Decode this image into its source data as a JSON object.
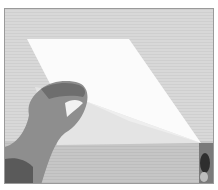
{
  "image": {
    "description": "Black-and-white photograph of a hand folding a sheet of white paper diagonally on a wooden table; a second hand holds the far corner at right edge",
    "subjects": [
      "sheet of paper",
      "left hand lifting paper corner",
      "fingers holding opposite corner",
      "wooden table surface"
    ],
    "colors": {
      "background": "#ffffff",
      "wood": "#d4d4d4",
      "wood_dark": "#c0c0c0",
      "paper": "#fafafa",
      "paper_shadow": "#e2e2e2",
      "skin": "#8a8a8a",
      "skin_dark": "#4a4a4a",
      "border": "#9a9a9a"
    }
  }
}
